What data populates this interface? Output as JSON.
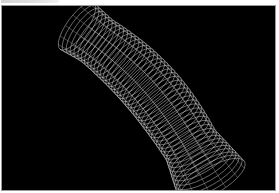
{
  "figure": {
    "background_color": "#000000",
    "mesh_color": "#e6e6e6",
    "caption_visible_text": ""
  }
}
